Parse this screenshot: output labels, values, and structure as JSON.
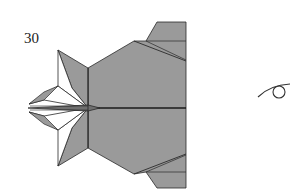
{
  "diagram": {
    "step_number": "30",
    "symbols": [
      "view-eye-icon"
    ],
    "colors": {
      "paper_colored_side": "#9a9a9a",
      "paper_white_side": "#ffffff",
      "line": "#2a2a2a",
      "background": "#ffffff"
    }
  }
}
